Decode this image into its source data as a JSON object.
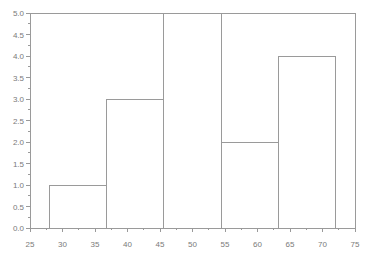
{
  "chart_data": {
    "type": "histogram",
    "title": "",
    "xlabel": "",
    "ylabel": "",
    "xlim": [
      25,
      75
    ],
    "ylim": [
      0,
      5
    ],
    "bin_edges": [
      28,
      36.8,
      45.6,
      54.4,
      63.2,
      72
    ],
    "counts": [
      1,
      3,
      5,
      2,
      4
    ],
    "x_tick_labels": [
      "25",
      "30",
      "35",
      "40",
      "45",
      "50",
      "55",
      "60",
      "65",
      "70",
      "75"
    ],
    "x_minor_ticks": [
      27.5,
      32.5,
      37.5,
      42.5,
      47.5,
      52.5,
      57.5,
      62.5,
      67.5,
      72.5
    ],
    "y_tick_labels": [
      "0.0",
      "0.5",
      "1.0",
      "1.5",
      "2.0",
      "2.5",
      "3.0",
      "3.5",
      "4.0",
      "4.5",
      "5.0"
    ],
    "y_minor_ticks": [
      0.25,
      0.75,
      1.25,
      1.75,
      2.25,
      2.75,
      3.25,
      3.75,
      4.25,
      4.75
    ],
    "grid": false,
    "box": true,
    "legend": null,
    "colors": {
      "line": "#9a9a9a",
      "text": "#7a7a7a",
      "background": "#ffffff",
      "bar_fill": "#ffffff"
    }
  }
}
